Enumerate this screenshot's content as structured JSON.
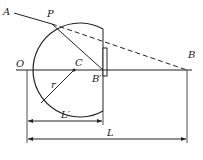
{
  "diagram": {
    "type": "geometric-optics",
    "labels": {
      "A": "A",
      "P": "P",
      "O": "O",
      "C": "C",
      "B_prime": "B′",
      "B": "B",
      "r": "r",
      "L_prime": "L′",
      "L": "L"
    },
    "colors": {
      "line": "#222222",
      "background": "#ffffff"
    }
  }
}
